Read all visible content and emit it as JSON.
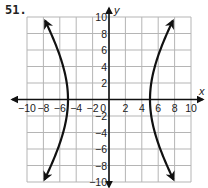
{
  "problem": {
    "number": "51."
  },
  "chart_data": {
    "type": "line",
    "title": "",
    "xlabel": "x",
    "ylabel": "y",
    "xlim": [
      -10,
      10
    ],
    "ylim": [
      -10,
      10
    ],
    "grid": true,
    "grid_step": 2,
    "x_ticks": [
      "−10",
      "−8",
      "−6",
      "−4",
      "−2",
      "0",
      "2",
      "4",
      "6",
      "8",
      "10"
    ],
    "y_ticks": [
      "10",
      "8",
      "6",
      "4",
      "2",
      "−2",
      "−4",
      "−6",
      "−8",
      "−10"
    ],
    "series": [
      {
        "name": "left branch",
        "equation": "x^2/25 - y^2/64 = 1",
        "vertex": [
          -5,
          0
        ],
        "endpoints": [
          [
            -8,
            10
          ],
          [
            -8,
            -10
          ]
        ],
        "arrows": true
      },
      {
        "name": "right branch",
        "equation": "x^2/25 - y^2/64 = 1",
        "vertex": [
          5,
          0
        ],
        "endpoints": [
          [
            8,
            10
          ],
          [
            8,
            -10
          ]
        ],
        "arrows": true
      }
    ],
    "curve_color": "#111111",
    "grid_color": "#b5b5b5"
  }
}
